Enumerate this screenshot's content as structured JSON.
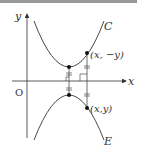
{
  "diagram": {
    "axis_x_label": "x",
    "axis_y_label": "y",
    "origin_label": "O",
    "curve_upper_label": "C",
    "curve_lower_label": "E",
    "point_upper_label": "(x, −y)",
    "point_lower_label": "(x,y)",
    "colors": {
      "stroke": "#333333",
      "header_bar": "#9a9a9a"
    }
  }
}
